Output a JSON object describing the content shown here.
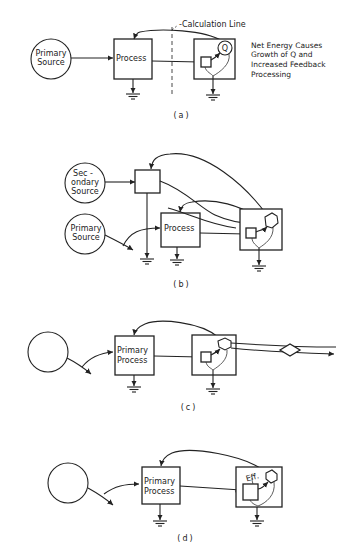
{
  "figure": {
    "panels": [
      {
        "id": "a",
        "caption": "(a)",
        "source_label_line1": "Primary",
        "source_label_line2": "Source",
        "process_label": "Process",
        "calculation_line_label": "-Calculation Line",
        "storage_label": "Q",
        "note_lines": [
          "Net Energy Causes",
          "Growth of Q and",
          "Increased Feedback",
          "Processing"
        ]
      },
      {
        "id": "b",
        "caption": "(b)",
        "secondary_label_line1": "Sec -",
        "secondary_label_line2": "ondary",
        "secondary_label_line3": "Source",
        "source_label_line1": "Primary",
        "source_label_line2": "Source",
        "process_label": "Process"
      },
      {
        "id": "c",
        "caption": "(c)",
        "process_label_line1": "Primary",
        "process_label_line2": "Process"
      },
      {
        "id": "d",
        "caption": "(d)",
        "process_label_line1": "Primary",
        "process_label_line2": "Process",
        "efficiency_label": "Eff."
      }
    ]
  }
}
